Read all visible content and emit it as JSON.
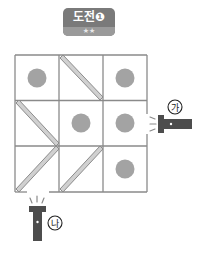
{
  "badge": {
    "title": "도전❶",
    "stars": "★★"
  },
  "grid": {
    "rows": 3,
    "cols": 3,
    "origin": [
      15,
      55
    ],
    "cell_size": [
      44,
      45.7
    ],
    "line_color": "#8a8a8a",
    "cells": [
      [
        "circle",
        "mirror-backslash",
        "circle"
      ],
      [
        "mirror-backslash",
        "circle",
        "circle"
      ],
      [
        "mirror-slash",
        "mirror-slash",
        "circle"
      ]
    ]
  },
  "colors": {
    "circle": "#a3a3a3",
    "mirror_fill": "#d0d0d0",
    "mirror_stroke": "#8c8c8c",
    "flashlight": "#4d4d4d"
  },
  "flashlights": [
    {
      "label": "㉮",
      "side": "right",
      "row": 1
    },
    {
      "label": "㉯",
      "side": "bottom",
      "col": 0
    }
  ]
}
